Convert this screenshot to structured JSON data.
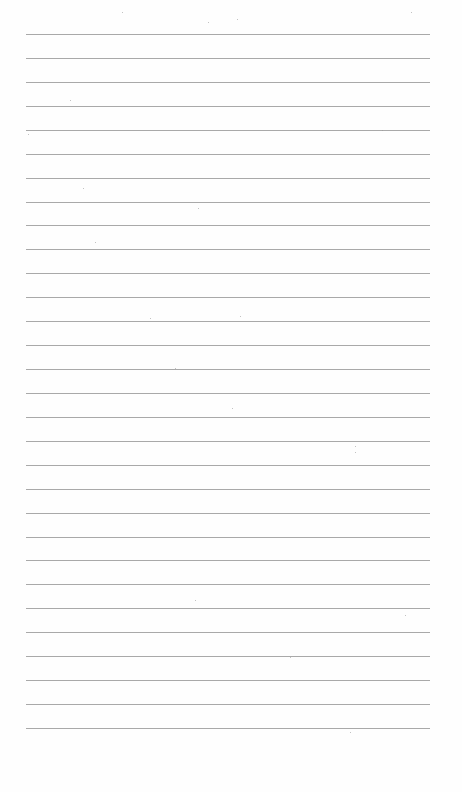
{
  "document": {
    "type": "blank ruled notebook page",
    "rule_count": 30,
    "rule_start_y": 34,
    "rule_spacing": 23.93,
    "rule_left": 26,
    "rule_right": 430,
    "rule_color": "#9a9a9a",
    "background_color": "#fefefe",
    "text": []
  }
}
